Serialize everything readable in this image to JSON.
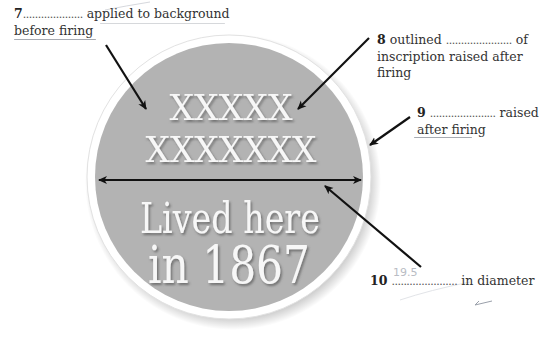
{
  "diagram": {
    "plaque": {
      "line1": "XXXXX",
      "line2": "XXXXXXX",
      "line3": "Lived here",
      "line4": "in 1867",
      "colors": {
        "background": "#b3b3b3",
        "rim": "#ffffff",
        "text": "#f7f7f7",
        "arrow": "#111111"
      }
    },
    "labels": [
      {
        "number": "7",
        "blank": "....................",
        "text_after": "applied to background",
        "text_line2": "before firing",
        "answer": ""
      },
      {
        "number": "8",
        "text_before": "outlined",
        "blank": "......................",
        "text_after": "of",
        "text_line2": "inscription raised after",
        "text_line3": "firing",
        "answer": ""
      },
      {
        "number": "9",
        "blank": "......................",
        "text_after": "raised",
        "text_line2": "after firing",
        "answer": ""
      },
      {
        "number": "10",
        "blank": "......................",
        "text_after": "in diameter",
        "answer": "19.5"
      }
    ],
    "marks": {
      "tick": "✓"
    }
  }
}
